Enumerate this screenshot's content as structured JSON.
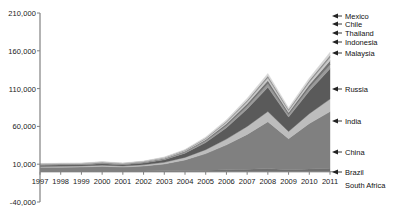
{
  "chart_data": {
    "type": "area",
    "stacked": true,
    "title": "",
    "xlabel": "",
    "ylabel": "",
    "grid": false,
    "legend_position": "right-callout",
    "categories": [
      1997,
      1998,
      1999,
      2000,
      2001,
      2002,
      2003,
      2004,
      2005,
      2006,
      2007,
      2008,
      2009,
      2010,
      2011
    ],
    "xtick_labels": [
      "1997",
      "1998",
      "1999",
      "2000",
      "2001",
      "2002",
      "2003",
      "2004",
      "2005",
      "2006",
      "2007",
      "2008",
      "2009",
      "2010",
      "2011"
    ],
    "ytick_labels": [
      "210,000",
      "160,000",
      "110,000",
      "60,000",
      "10,000",
      "-40,000"
    ],
    "ytick_values": [
      210000,
      160000,
      110000,
      60000,
      10000,
      -40000
    ],
    "ylim": [
      -40000,
      210000
    ],
    "series": [
      {
        "name": "South Africa",
        "color": "#6f6f6f",
        "values": [
          900,
          900,
          900,
          1000,
          1000,
          1100,
          1300,
          1600,
          2000,
          2600,
          3400,
          4200,
          2800,
          3800,
          4600
        ]
      },
      {
        "name": "China",
        "color": "#808080",
        "values": [
          5000,
          5200,
          5400,
          6200,
          5200,
          6500,
          9000,
          14000,
          22000,
          33000,
          46000,
          62000,
          41000,
          60000,
          75000
        ]
      },
      {
        "name": "India",
        "color": "#bdbdbd",
        "values": [
          1200,
          1300,
          1300,
          1500,
          1300,
          1600,
          2200,
          3400,
          5200,
          7600,
          10500,
          13500,
          9500,
          13000,
          16500
        ]
      },
      {
        "name": "Russia",
        "color": "#5a5a5a",
        "values": [
          1600,
          1700,
          1600,
          2000,
          1800,
          2300,
          3400,
          5600,
          9500,
          15000,
          23000,
          32000,
          19000,
          30000,
          40000
        ]
      },
      {
        "name": "Malaysia",
        "color": "#9a9a9a",
        "values": [
          700,
          700,
          700,
          800,
          700,
          800,
          1000,
          1400,
          2000,
          2800,
          3800,
          4800,
          3200,
          4400,
          5600
        ]
      },
      {
        "name": "Indonesia",
        "color": "#737373",
        "values": [
          500,
          500,
          500,
          600,
          500,
          600,
          800,
          1100,
          1700,
          2400,
          3300,
          4300,
          2900,
          4000,
          5200
        ]
      },
      {
        "name": "Thailand",
        "color": "#c9c9c9",
        "values": [
          400,
          400,
          400,
          500,
          400,
          500,
          700,
          900,
          1400,
          2000,
          2700,
          3500,
          2400,
          3300,
          4200
        ]
      },
      {
        "name": "Chile",
        "color": "#8c8c8c",
        "values": [
          300,
          300,
          300,
          350,
          300,
          350,
          500,
          700,
          1000,
          1500,
          2000,
          2600,
          1800,
          2500,
          3100
        ]
      },
      {
        "name": "Mexico",
        "color": "#d6d6d6",
        "values": [
          400,
          400,
          400,
          450,
          400,
          450,
          600,
          850,
          1300,
          1800,
          2500,
          3200,
          2200,
          3000,
          3800
        ]
      },
      {
        "name": "Brazil",
        "color": "#4d4d4d",
        "values": [
          0,
          0,
          0,
          0,
          0,
          0,
          0,
          0,
          0,
          0,
          0,
          0,
          0,
          0,
          0
        ]
      }
    ]
  },
  "legend": {
    "items": [
      {
        "label": "Mexico"
      },
      {
        "label": "Chile"
      },
      {
        "label": "Thailand"
      },
      {
        "label": "Indonesia"
      },
      {
        "label": "Malaysia"
      },
      {
        "label": "Russia"
      },
      {
        "label": "India"
      },
      {
        "label": "China"
      },
      {
        "label": "Brazil"
      },
      {
        "label": "South Africa"
      }
    ]
  },
  "axis": {
    "line_color": "#808080",
    "text_color": "#1a1a1a"
  }
}
